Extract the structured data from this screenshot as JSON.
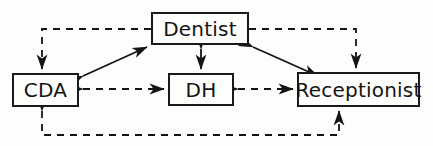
{
  "diagram": {
    "type": "node-link-diagram",
    "canvas": {
      "width": 433,
      "height": 146,
      "background": "#fdfdfb"
    },
    "stroke_color": "#141414",
    "nodes": [
      {
        "id": "dentist",
        "label": "Dentist",
        "x": 151,
        "y": 12,
        "width": 98,
        "height": 33
      },
      {
        "id": "cda",
        "label": "CDA",
        "x": 12,
        "y": 73,
        "width": 67,
        "height": 34
      },
      {
        "id": "dh",
        "label": "DH",
        "x": 168,
        "y": 73,
        "width": 66,
        "height": 33
      },
      {
        "id": "receptionist",
        "label": "Receptionist",
        "x": 297,
        "y": 72,
        "width": 123,
        "height": 35
      }
    ],
    "edges": [
      {
        "id": "cda-dentist",
        "from": "cda",
        "to": "dentist",
        "style": "solid",
        "arrows": "both",
        "routing": "diagonal"
      },
      {
        "id": "dentist-dh",
        "from": "dentist",
        "to": "dh",
        "style": "solid",
        "arrows": "both",
        "routing": "vertical"
      },
      {
        "id": "dentist-receptionist",
        "from": "dentist",
        "to": "receptionist",
        "style": "solid",
        "arrows": "both",
        "routing": "diagonal"
      },
      {
        "id": "cda-dh",
        "from": "cda",
        "to": "dh",
        "style": "dashed",
        "arrows": "both",
        "routing": "horizontal"
      },
      {
        "id": "dh-receptionist",
        "from": "dh",
        "to": "receptionist",
        "style": "dashed",
        "arrows": "both",
        "routing": "horizontal"
      },
      {
        "id": "dentist-cda-dashed",
        "from": "dentist",
        "to": "cda",
        "style": "dashed",
        "arrows": "forward",
        "routing": "orthogonal-top-left"
      },
      {
        "id": "dentist-recep-dashed",
        "from": "dentist",
        "to": "receptionist",
        "style": "dashed",
        "arrows": "forward",
        "routing": "orthogonal-top-right"
      },
      {
        "id": "cda-recep-dashed",
        "from": "cda",
        "to": "receptionist",
        "style": "dashed",
        "arrows": "both",
        "routing": "orthogonal-bottom"
      }
    ]
  }
}
